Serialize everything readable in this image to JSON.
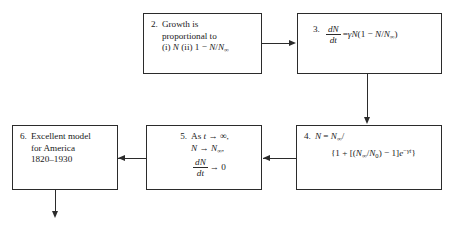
{
  "diagram": {
    "type": "flow-chart",
    "line_color": "#2b2b2b",
    "background": "#ffffff",
    "nodes": [
      {
        "id": "box2",
        "number": "2.",
        "lines": [
          "Growth is",
          "proportional to",
          "(i) N (ii) 1 − N/N∞"
        ],
        "line1": "Growth is",
        "line2": "proportional to",
        "line3_prefix": "(i) ",
        "line3_var1": "N",
        "line3_mid": " (ii) 1 − ",
        "line3_var2": "N",
        "line3_slash": "/",
        "line3_var3": "N",
        "line3_sub": "∞"
      },
      {
        "id": "box3",
        "number": "3.",
        "equation": "dN/dt = γN(1 − N/N∞)",
        "frac_top": "dN",
        "frac_bot": "dt",
        "rhs_eq": "=",
        "rhs_gamma": "γ",
        "rhs_N": "N",
        "rhs_open": "(1 − ",
        "rhs_N2": "N",
        "rhs_slash": "/",
        "rhs_N3": "N",
        "rhs_sub": "∞",
        "rhs_close": ")"
      },
      {
        "id": "box4",
        "number": "4.",
        "equation": "N = N∞/{1 + [(N∞/N0) − 1]e^(−γt)}",
        "line1_N": "N",
        "line1_eq": " = ",
        "line1_Ninf": "N",
        "line1_sub": "∞",
        "line1_tail": "/",
        "line2_open": "{1 + [(",
        "line2_Ninf": "N",
        "line2_sub1": "∞",
        "line2_slash": "/",
        "line2_N0": "N",
        "line2_sub0": "0",
        "line2_mid": ") − 1]",
        "line2_e": "e",
        "line2_exp_minus": "−",
        "line2_exp_gamma": "γ",
        "line2_exp_t": "t",
        "line2_close": "}"
      },
      {
        "id": "box5",
        "number": "5.",
        "line1_prefix": "As ",
        "line1_t": "t",
        "line1_arrow": " → ∞,",
        "line2_N": "N",
        "line2_arrow": " → ",
        "line2_Ninf": "N",
        "line2_sub": "∞",
        "line2_comma": ",",
        "frac_top": "dN",
        "frac_bot": "dt",
        "line3_arrow": "→ 0"
      },
      {
        "id": "box6",
        "number": "6.",
        "line1": "Excellent model",
        "line2": "for America",
        "line3": "1820–1930"
      }
    ],
    "connectors": [
      {
        "id": "arrow-2-to-3",
        "from": "box2",
        "to": "box3",
        "direction": "right"
      },
      {
        "id": "arrow-3-to-4",
        "from": "box3",
        "to": "box4",
        "direction": "down"
      },
      {
        "id": "arrow-4-to-5",
        "from": "box4",
        "to": "box5",
        "direction": "left"
      },
      {
        "id": "arrow-5-to-6",
        "from": "box5",
        "to": "box6",
        "direction": "left"
      },
      {
        "id": "arrow-6-out",
        "from": "box6",
        "to": "",
        "direction": "down"
      }
    ]
  }
}
